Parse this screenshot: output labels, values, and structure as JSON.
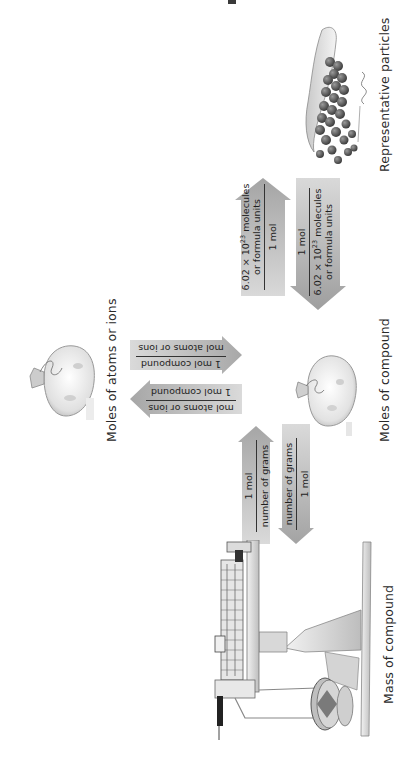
{
  "diagram": {
    "orientation": "rotated-90-ccw",
    "nodes": {
      "particles": {
        "label": "Representative particles",
        "icon": "particles-pile-icon"
      },
      "moles_compound": {
        "label": "Moles of compound",
        "icon": "mole-bag-icon"
      },
      "mass_compound": {
        "label": "Mass of compound",
        "icon": "balance-scale-icon"
      },
      "moles_atoms": {
        "label": "Moles of atoms or ions",
        "icon": "mole-bag-icon"
      }
    },
    "arrows": {
      "moles_to_particles": {
        "direction": "to-particles",
        "numerator_a": "6.02 × 10",
        "numerator_exp": "23",
        "numerator_b": " molecules",
        "numerator_line2": "or formula units",
        "denominator": "1 mol"
      },
      "particles_to_moles": {
        "direction": "to-moles",
        "numerator": "1 mol",
        "denominator_a": "6.02 × 10",
        "denominator_exp": "23",
        "denominator_b": " molecules",
        "denominator_line2": "or formula units"
      },
      "mass_to_moles": {
        "direction": "to-moles",
        "numerator": "1 mol",
        "denominator": "number of grams"
      },
      "moles_to_mass": {
        "direction": "to-mass",
        "numerator": "number of grams",
        "denominator": "1 mol"
      },
      "compound_to_atoms": {
        "direction": "to-atoms",
        "numerator": "mol atoms or ions",
        "denominator": "1 mol compound"
      },
      "atoms_to_compound": {
        "direction": "to-compound",
        "numerator": "1 mol compound",
        "denominator": "mol atoms or ions"
      }
    },
    "colors": {
      "arrow_fill_light": "#d6d6d6",
      "arrow_fill_dark": "#a9a9a9",
      "text": "#222222",
      "background": "#ffffff"
    }
  }
}
